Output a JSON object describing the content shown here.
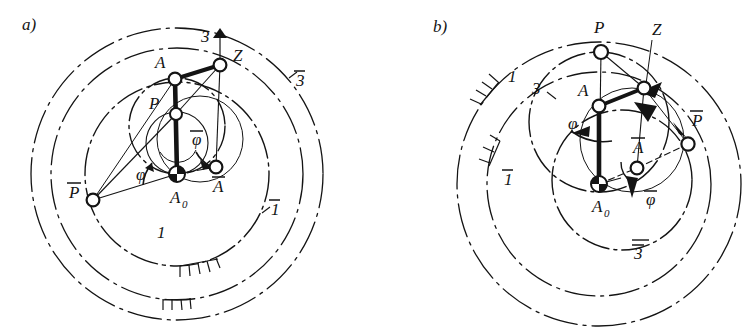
{
  "figure": {
    "title_hidden": "",
    "background_color": "#ffffff",
    "ink_color": "#141414",
    "panels": [
      {
        "id": "a",
        "tag": "a)",
        "tag_pos": {
          "x": 22,
          "y": 30
        },
        "center": {
          "x": 177,
          "y": 174
        },
        "circles": [
          {
            "name": "1",
            "label": "1",
            "label_pos": {
              "x": 157,
              "y": 238
            },
            "r": 92,
            "style": "dashdot",
            "hatched": true
          },
          {
            "name": "1bar",
            "label": "1",
            "overbar": true,
            "label_pos": {
              "x": 271,
              "y": 215
            },
            "r": 126,
            "style": "dashdot",
            "hatched": true
          },
          {
            "name": "3",
            "label": "3",
            "label_pos": {
              "x": 201,
              "y": 42
            },
            "r": 48,
            "style": "dashdot",
            "hatched": false
          },
          {
            "name": "3bar",
            "label": "3",
            "overbar": true,
            "label_pos": {
              "x": 296,
              "y": 86
            },
            "r": 146,
            "style": "dashdot",
            "hatched": false
          }
        ],
        "points": [
          {
            "name": "A0",
            "label": "A",
            "subscript": "0",
            "x": 177,
            "y": 174,
            "kind": "fixed-pivot",
            "label_pos": {
              "x": 170,
              "y": 203
            }
          },
          {
            "name": "A",
            "label": "A",
            "x": 175,
            "y": 79,
            "kind": "joint",
            "label_pos": {
              "x": 155,
              "y": 68
            }
          },
          {
            "name": "Abar",
            "label": "A",
            "overbar": true,
            "x": 216,
            "y": 167,
            "kind": "joint",
            "label_pos": {
              "x": 213,
              "y": 192
            }
          },
          {
            "name": "Z",
            "label": "Z",
            "x": 220,
            "y": 65,
            "kind": "joint",
            "label_pos": {
              "x": 233,
              "y": 61
            }
          },
          {
            "name": "P",
            "label": "P",
            "x": 176,
            "y": 114,
            "kind": "joint",
            "label_pos": {
              "x": 149,
              "y": 109
            }
          },
          {
            "name": "Pbar",
            "label": "P",
            "overbar": true,
            "x": 93,
            "y": 200,
            "kind": "joint",
            "label_pos": {
              "x": 69,
              "y": 198
            }
          }
        ],
        "angle_arrows": [
          {
            "name": "phi",
            "label": "φ",
            "label_pos": {
              "x": 146,
              "y": 172
            },
            "overbar": false
          },
          {
            "name": "phibar",
            "label": "φ",
            "label_pos": {
              "x": 196,
              "y": 140
            },
            "overbar": true
          }
        ]
      },
      {
        "id": "b",
        "tag": "b)",
        "tag_pos": {
          "x": 433,
          "y": 32
        },
        "center": {
          "x": 599,
          "y": 184
        },
        "circles": [
          {
            "name": "1",
            "label": "1",
            "label_pos": {
              "x": 512,
              "y": 77
            },
            "r": 142,
            "style": "dashdot",
            "hatched": true
          },
          {
            "name": "1bar",
            "label": "1",
            "overbar": true,
            "label_pos": {
              "x": 505,
              "y": 175
            },
            "r": 112,
            "style": "dashdot",
            "hatched": true
          },
          {
            "name": "3",
            "label": "3",
            "label_pos": {
              "x": 535,
              "y": 88
            },
            "r": 70,
            "style": "dashdot",
            "hatched": false
          },
          {
            "name": "3bar",
            "label": "3",
            "overbar": true,
            "label_pos": {
              "x": 637,
              "y": 255
            },
            "r": 52,
            "style": "dashdot",
            "hatched": false
          }
        ],
        "points": [
          {
            "name": "A0",
            "label": "A",
            "subscript": "0",
            "x": 599,
            "y": 184,
            "kind": "fixed-pivot",
            "label_pos": {
              "x": 592,
              "y": 212
            }
          },
          {
            "name": "A",
            "label": "A",
            "x": 599,
            "y": 106,
            "kind": "joint",
            "label_pos": {
              "x": 581,
              "y": 93
            }
          },
          {
            "name": "Abar",
            "label": "A",
            "overbar": true,
            "x": 637,
            "y": 168,
            "kind": "joint",
            "label_pos": {
              "x": 633,
              "y": 148
            }
          },
          {
            "name": "Z",
            "label": "Z",
            "x": 644,
            "y": 88,
            "kind": "joint",
            "label_pos": {
              "x": 652,
              "y": 35
            }
          },
          {
            "name": "P",
            "label": "P",
            "x": 601,
            "y": 52,
            "kind": "joint",
            "label_pos": {
              "x": 594,
              "y": 33
            }
          },
          {
            "name": "Pbar",
            "label": "P",
            "overbar": true,
            "x": 688,
            "y": 144,
            "kind": "joint",
            "label_pos": {
              "x": 692,
              "y": 123
            }
          }
        ],
        "angle_arrows": [
          {
            "name": "phi",
            "label": "φ",
            "label_pos": {
              "x": 573,
              "y": 123
            },
            "overbar": false
          },
          {
            "name": "phibar",
            "label": "φ",
            "label_pos": {
              "x": 652,
              "y": 198
            },
            "overbar": true
          }
        ]
      }
    ]
  }
}
